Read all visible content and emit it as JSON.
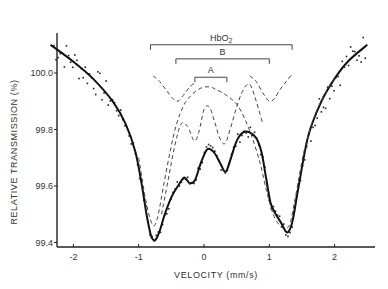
{
  "chart_data": {
    "type": "line",
    "title": "",
    "xlabel": "VELOCITY (mm/s)",
    "ylabel": "RELATIVE TRANSMISSION (%)",
    "xlim": [
      -2.45,
      2.6
    ],
    "ylim": [
      99.38,
      100.14
    ],
    "xticks": [
      -2,
      -1,
      0,
      1,
      2
    ],
    "xtick_labels": [
      "-2",
      "-1",
      "0",
      "1",
      "2"
    ],
    "yticks": [
      99.4,
      99.6,
      99.8,
      100.0
    ],
    "ytick_labels": [
      "99.4",
      "99.6",
      "99.8",
      "100.0"
    ],
    "grid": false,
    "brackets": [
      {
        "label": "HbO2",
        "x0": -0.82,
        "x1": 1.35,
        "y": 100.1
      },
      {
        "label": "B",
        "x0": -0.43,
        "x1": 1.0,
        "y": 100.05
      },
      {
        "label": "A",
        "x0": -0.14,
        "x1": 0.35,
        "y": 99.985
      }
    ],
    "series": [
      {
        "name": "Fit (total)",
        "style": "solid",
        "x": [
          -2.35,
          -2.0,
          -1.7,
          -1.4,
          -1.2,
          -1.05,
          -0.95,
          -0.88,
          -0.82,
          -0.78,
          -0.74,
          -0.68,
          -0.6,
          -0.5,
          -0.4,
          -0.3,
          -0.22,
          -0.14,
          -0.05,
          0.05,
          0.15,
          0.25,
          0.33,
          0.4,
          0.5,
          0.6,
          0.7,
          0.8,
          0.88,
          0.95,
          1.02,
          1.1,
          1.18,
          1.25,
          1.3,
          1.36,
          1.45,
          1.6,
          1.8,
          2.0,
          2.2,
          2.5
        ],
        "y": [
          100.1,
          100.04,
          99.98,
          99.9,
          99.82,
          99.72,
          99.6,
          99.5,
          99.43,
          99.41,
          99.41,
          99.44,
          99.5,
          99.56,
          99.6,
          99.63,
          99.61,
          99.62,
          99.68,
          99.73,
          99.72,
          99.68,
          99.65,
          99.69,
          99.76,
          99.79,
          99.79,
          99.77,
          99.72,
          99.63,
          99.54,
          99.5,
          99.47,
          99.44,
          99.44,
          99.48,
          99.6,
          99.78,
          99.9,
          99.98,
          100.04,
          100.1
        ]
      },
      {
        "name": "HbO2 component",
        "style": "dashed",
        "x": [
          -1.0,
          -0.9,
          -0.82,
          -0.76,
          -0.7,
          -0.62,
          -0.52,
          -0.42,
          -0.3,
          -0.2,
          -0.1,
          0.0,
          0.1,
          0.2,
          0.35,
          0.5,
          0.62,
          0.74,
          0.86,
          0.96,
          1.06,
          1.16,
          1.25,
          1.32,
          1.4,
          1.55,
          1.75,
          2.0
        ],
        "y": [
          99.7,
          99.56,
          99.48,
          99.46,
          99.5,
          99.6,
          99.72,
          99.82,
          99.89,
          99.92,
          99.94,
          99.95,
          99.95,
          99.94,
          99.92,
          99.89,
          99.84,
          99.77,
          99.68,
          99.58,
          99.5,
          99.46,
          99.45,
          99.47,
          99.56,
          99.74,
          99.88,
          99.98
        ]
      },
      {
        "name": "A + B components",
        "style": "dashed",
        "x": [
          -0.65,
          -0.55,
          -0.45,
          -0.35,
          -0.25,
          -0.15,
          -0.08,
          0.0,
          0.08,
          0.16,
          0.24,
          0.32,
          0.4,
          0.5,
          0.6,
          0.7,
          0.8,
          0.9
        ],
        "y": [
          99.5,
          99.62,
          99.74,
          99.82,
          99.81,
          99.76,
          99.79,
          99.87,
          99.88,
          99.83,
          99.77,
          99.75,
          99.8,
          99.88,
          99.94,
          99.96,
          99.9,
          99.82
        ]
      },
      {
        "name": "Doublet B (upper)",
        "style": "dashed",
        "x": [
          -0.78,
          -0.68,
          -0.58,
          -0.48,
          -0.4,
          -0.32,
          -0.22,
          -0.12,
          0.7,
          0.8,
          0.9,
          1.0,
          1.08,
          1.16,
          1.26,
          1.36
        ],
        "y": [
          99.99,
          99.97,
          99.94,
          99.91,
          99.9,
          99.92,
          99.95,
          99.97,
          99.99,
          99.97,
          99.93,
          99.9,
          99.91,
          99.94,
          99.97,
          100.0
        ]
      }
    ],
    "scatter_points": "Noisy experimental data points scattered around the solid fit curve across the full velocity range"
  }
}
